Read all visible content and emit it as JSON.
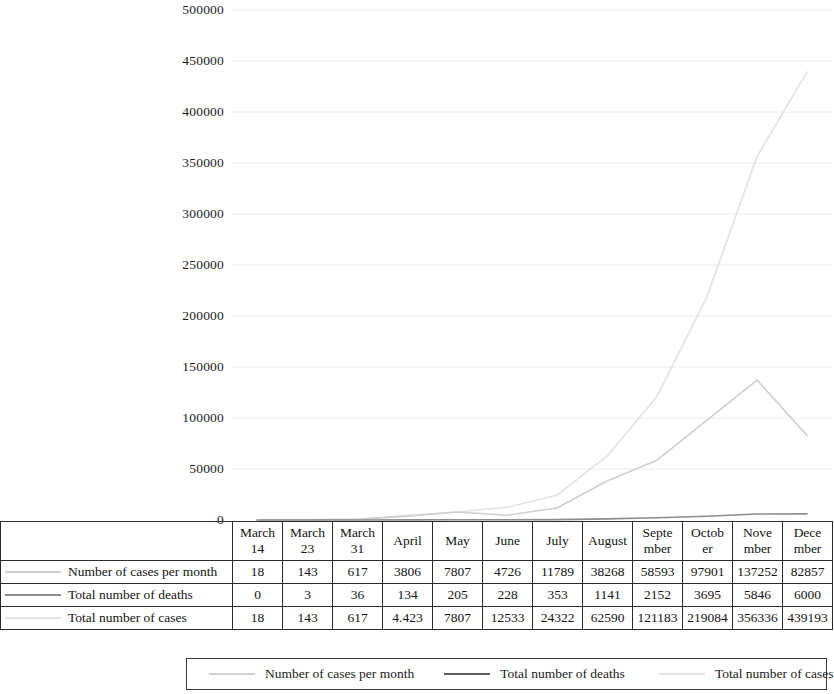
{
  "chart_data": {
    "type": "line",
    "title": "",
    "xlabel": "",
    "ylabel": "",
    "ylim": [
      0,
      500000
    ],
    "grid": true,
    "legend_position": "bottom",
    "categories": [
      "March 14",
      "March 23",
      "March 31",
      "April",
      "May",
      "June",
      "July",
      "August",
      "September",
      "October",
      "November",
      "December"
    ],
    "y_ticks": [
      "500000",
      "450000",
      "400000",
      "350000",
      "300000",
      "250000",
      "200000",
      "150000",
      "100000",
      "50000",
      "0"
    ],
    "y_tick_values": [
      500000,
      450000,
      400000,
      350000,
      300000,
      250000,
      200000,
      150000,
      100000,
      50000,
      0
    ],
    "series": [
      {
        "name": "Number of cases per month",
        "color": "#cfcfcf",
        "values": [
          18,
          143,
          617,
          3806,
          7807,
          4726,
          11789,
          38268,
          58593,
          97901,
          137252,
          82857
        ],
        "display_values": [
          "18",
          "143",
          "617",
          "3806",
          "7807",
          "4726",
          "11789",
          "38268",
          "58593",
          "97901",
          "137252",
          "82857"
        ]
      },
      {
        "name": "Total number of deaths",
        "color": "#8d8d8d",
        "values": [
          0,
          3,
          36,
          134,
          205,
          228,
          353,
          1141,
          2152,
          3695,
          5846,
          6000
        ],
        "display_values": [
          "0",
          "3",
          "36",
          "134",
          "205",
          "228",
          "353",
          "1141",
          "2152",
          "3695",
          "5846",
          "6000"
        ]
      },
      {
        "name": "Total number of cases",
        "color": "#e2e2e2",
        "values": [
          18,
          143,
          617,
          4423,
          7807,
          12533,
          24322,
          62590,
          121183,
          219084,
          356336,
          439193
        ],
        "display_values": [
          "18",
          "143",
          "617",
          "4.423",
          "7807",
          "12533",
          "24322",
          "62590",
          "121183",
          "219084",
          "356336",
          "439193"
        ]
      }
    ]
  },
  "table": {
    "headers": [
      {
        "line1": "March",
        "line2": "14"
      },
      {
        "line1": "March",
        "line2": "23"
      },
      {
        "line1": "March",
        "line2": "31"
      },
      {
        "line1": "April",
        "line2": ""
      },
      {
        "line1": "May",
        "line2": ""
      },
      {
        "line1": "June",
        "line2": ""
      },
      {
        "line1": "July",
        "line2": ""
      },
      {
        "line1": "August",
        "line2": ""
      },
      {
        "line1": "Septe",
        "line2": "mber"
      },
      {
        "line1": "Octob",
        "line2": "er"
      },
      {
        "line1": "Nove",
        "line2": "mber"
      },
      {
        "line1": "Dece",
        "line2": "mber"
      }
    ],
    "rows": [
      {
        "label": "Number of cases per month",
        "swatch": "s-monthly",
        "cells": [
          "18",
          "143",
          "617",
          "3806",
          "7807",
          "4726",
          "11789",
          "38268",
          "58593",
          "97901",
          "137252",
          "82857"
        ]
      },
      {
        "label": "Total number of deaths",
        "swatch": "s-deaths",
        "cells": [
          "0",
          "3",
          "36",
          "134",
          "205",
          "228",
          "353",
          "1141",
          "2152",
          "3695",
          "5846",
          "6000"
        ]
      },
      {
        "label": "Total number of cases",
        "swatch": "s-total",
        "cells": [
          "18",
          "143",
          "617",
          "4.423",
          "7807",
          "12533",
          "24322",
          "62590",
          "121183",
          "219084",
          "356336",
          "439193"
        ]
      }
    ]
  },
  "legend": {
    "items": [
      {
        "label": "Number of cases per month",
        "swatch": "s-monthly"
      },
      {
        "label": "Total number of deaths",
        "swatch": "s-deaths"
      },
      {
        "label": "Total number of cases",
        "swatch": "s-total"
      }
    ]
  },
  "colors": {
    "monthly_cases": "#cfcfcf",
    "total_deaths": "#8d8d8d",
    "total_cases": "#e2e2e2",
    "gridline": "#ececec",
    "text": "#1a1a1a"
  }
}
